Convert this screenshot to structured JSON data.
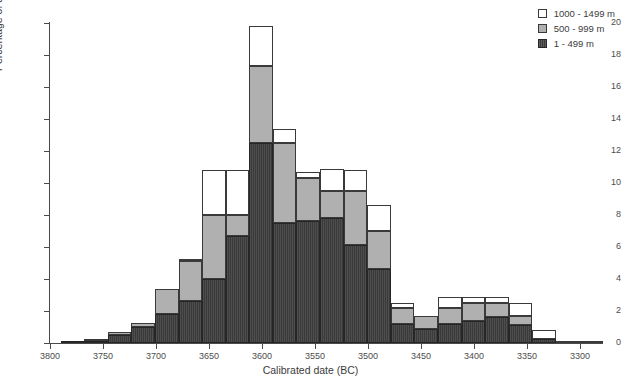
{
  "chart_data": {
    "type": "bar",
    "stacked": true,
    "title": "",
    "xlabel": "Calibrated date (BC)",
    "ylabel": "Percentage of ditch length",
    "xlim": [
      3800,
      3300
    ],
    "ylim": [
      0,
      20
    ],
    "x_reversed": true,
    "grid": false,
    "legend_position": "top-right",
    "xticks": [
      "3800",
      "3750",
      "3700",
      "3650",
      "3600",
      "3550",
      "3500",
      "3450",
      "3400",
      "3350",
      "3300"
    ],
    "yticks": [
      "0",
      "2",
      "4",
      "6",
      "8",
      "10",
      "12",
      "14",
      "16",
      "18",
      "20"
    ],
    "bin_width_years": 22.25,
    "bin_starts": [
      3790,
      3767.75,
      3745.5,
      3723.25,
      3701,
      3678.75,
      3656.5,
      3634.25,
      3612,
      3589.75,
      3567.5,
      3545.25,
      3523,
      3500.75,
      3478.5,
      3456.25,
      3434,
      3411.75,
      3389.5,
      3367.25,
      3345,
      3322.75,
      3300.5
    ],
    "series": [
      {
        "name": "1 - 499 m",
        "color": "#3a3a3a",
        "values": [
          0.05,
          0.15,
          0.5,
          1.0,
          1.8,
          2.6,
          4.0,
          6.7,
          12.5,
          7.5,
          7.6,
          7.8,
          6.1,
          4.6,
          1.2,
          0.9,
          1.2,
          1.4,
          1.6,
          1.1,
          0.25,
          0.0,
          0.0
        ]
      },
      {
        "name": "500 - 999 m",
        "color": "#b0b0b0",
        "values": [
          0.0,
          0.05,
          0.2,
          0.25,
          1.6,
          2.5,
          4.0,
          1.3,
          4.8,
          5.0,
          2.7,
          1.7,
          3.4,
          2.4,
          1.0,
          0.8,
          1.0,
          1.1,
          0.9,
          0.6,
          0.0,
          0.0,
          0.0
        ]
      },
      {
        "name": "1000 - 1499 m",
        "color": "#ffffff",
        "values": [
          0.0,
          0.0,
          0.0,
          0.0,
          0.0,
          0.1,
          2.8,
          2.8,
          2.5,
          0.9,
          0.4,
          1.4,
          1.3,
          1.6,
          0.3,
          0.0,
          0.7,
          0.4,
          0.4,
          0.8,
          0.55,
          0.1,
          0.05
        ]
      }
    ]
  },
  "legend": {
    "items": [
      {
        "label": "1000 - 1499 m",
        "swatch": "s2"
      },
      {
        "label": "500 - 999 m",
        "swatch": "s1"
      },
      {
        "label": "1 - 499 m",
        "swatch": "s0"
      }
    ]
  }
}
